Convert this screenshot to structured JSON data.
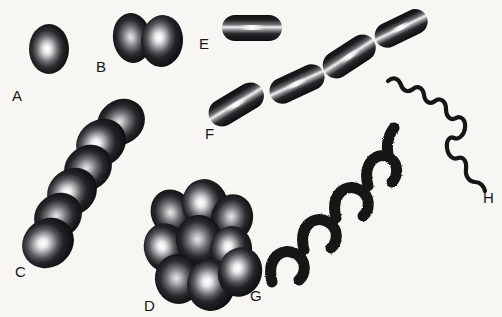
{
  "figure": {
    "title": "Bacterial cell shapes and arrangements",
    "background_color": "#f7f6f3",
    "cell_fill_color": "#121214",
    "cell_highlight_color": "#ffffff",
    "label_color": "#17171a",
    "width": 502,
    "height": 317
  },
  "specimens": [
    {
      "id": "A",
      "label": "A",
      "name": "coccus",
      "shape": "single-ovoid",
      "label_x": 12,
      "label_y": 88,
      "units": 1
    },
    {
      "id": "B",
      "label": "B",
      "name": "diplococcus",
      "shape": "paired-ovoid",
      "label_x": 96,
      "label_y": 59,
      "units": 2
    },
    {
      "id": "C",
      "label": "C",
      "name": "streptococcus",
      "shape": "chain-of-cocci",
      "label_x": 15,
      "label_y": 264,
      "units": 6
    },
    {
      "id": "D",
      "label": "D",
      "name": "staphylococcus",
      "shape": "cluster-of-cocci",
      "label_x": 144,
      "label_y": 298,
      "units": 9
    },
    {
      "id": "E",
      "label": "E",
      "name": "bacillus",
      "shape": "single-rod",
      "label_x": 199,
      "label_y": 36,
      "units": 1
    },
    {
      "id": "F",
      "label": "F",
      "name": "streptobacillus",
      "shape": "chain-of-rods",
      "label_x": 205,
      "label_y": 126,
      "units": 4
    },
    {
      "id": "G",
      "label": "G",
      "name": "spirillum",
      "shape": "rigid-helix",
      "label_x": 250,
      "label_y": 288,
      "units": 1
    },
    {
      "id": "H",
      "label": "H",
      "name": "spirochete",
      "shape": "flexible-spiral-filament",
      "label_x": 483,
      "label_y": 190,
      "units": 1
    }
  ]
}
